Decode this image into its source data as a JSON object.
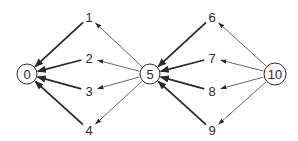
{
  "diagram": {
    "type": "directed-graph",
    "colors": {
      "stroke": "#2a2a2a",
      "thin_edge": "#555555",
      "background": "#ffffff"
    },
    "circled_nodes": [
      {
        "id": "n0",
        "label": "0",
        "x": 27,
        "y": 74,
        "r": 10
      },
      {
        "id": "n5",
        "label": "5",
        "x": 150,
        "y": 74,
        "r": 10
      },
      {
        "id": "n10",
        "label": "10",
        "x": 275,
        "y": 74,
        "r": 11
      }
    ],
    "plain_nodes": [
      {
        "id": "n1",
        "label": "1",
        "x": 89,
        "y": 17
      },
      {
        "id": "n2",
        "label": "2",
        "x": 89,
        "y": 58
      },
      {
        "id": "n3",
        "label": "3",
        "x": 89,
        "y": 91
      },
      {
        "id": "n4",
        "label": "4",
        "x": 89,
        "y": 130
      },
      {
        "id": "n6",
        "label": "6",
        "x": 212,
        "y": 17
      },
      {
        "id": "n7",
        "label": "7",
        "x": 212,
        "y": 58
      },
      {
        "id": "n8",
        "label": "8",
        "x": 212,
        "y": 91
      },
      {
        "id": "n9",
        "label": "9",
        "x": 212,
        "y": 130
      }
    ],
    "edges": [
      {
        "from": "5",
        "to": "1",
        "weight": "thin"
      },
      {
        "from": "5",
        "to": "2",
        "weight": "thin"
      },
      {
        "from": "5",
        "to": "3",
        "weight": "thin"
      },
      {
        "from": "5",
        "to": "4",
        "weight": "thin"
      },
      {
        "from": "1",
        "to": "0",
        "weight": "thick"
      },
      {
        "from": "2",
        "to": "0",
        "weight": "thick"
      },
      {
        "from": "3",
        "to": "0",
        "weight": "thick"
      },
      {
        "from": "4",
        "to": "0",
        "weight": "thick"
      },
      {
        "from": "10",
        "to": "6",
        "weight": "thin"
      },
      {
        "from": "10",
        "to": "7",
        "weight": "thin"
      },
      {
        "from": "10",
        "to": "8",
        "weight": "thin"
      },
      {
        "from": "10",
        "to": "9",
        "weight": "thin"
      },
      {
        "from": "6",
        "to": "5",
        "weight": "thick"
      },
      {
        "from": "7",
        "to": "5",
        "weight": "thick"
      },
      {
        "from": "8",
        "to": "5",
        "weight": "thick"
      },
      {
        "from": "9",
        "to": "5",
        "weight": "thick"
      }
    ]
  }
}
